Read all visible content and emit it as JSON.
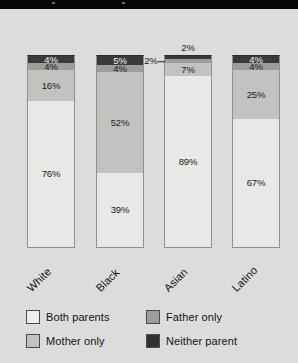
{
  "chart_data": {
    "type": "bar",
    "subtype": "stacked-bar-100",
    "title": "",
    "xlabel": "",
    "ylabel": "",
    "ylim": [
      0,
      100
    ],
    "grid": false,
    "legend_position": "bottom",
    "categories": [
      "White",
      "Black",
      "Asian",
      "Latino"
    ],
    "series": [
      {
        "name": "Both parents",
        "color": "#e8e8e6",
        "values": [
          76,
          39,
          89,
          67
        ]
      },
      {
        "name": "Mother only",
        "color": "#c2c2c0",
        "values": [
          16,
          52,
          0,
          25
        ]
      },
      {
        "name": "Father only",
        "color": "#9d9d9b",
        "values": [
          4,
          4,
          7,
          4
        ]
      },
      {
        "name": "Neither parent",
        "color": "#3a3a3a",
        "values": [
          4,
          5,
          2,
          4
        ]
      }
    ],
    "bars": [
      {
        "category": "White",
        "segments": [
          {
            "series": "Neither parent",
            "value": 4,
            "label": "4%",
            "label_style": "light",
            "label_placement": "inside"
          },
          {
            "series": "Father only",
            "value": 4,
            "label": "4%",
            "label_style": "dark",
            "label_placement": "inside"
          },
          {
            "series": "Mother only",
            "value": 16,
            "label": "16%",
            "label_style": "dark",
            "label_placement": "inside"
          },
          {
            "series": "Both parents",
            "value": 76,
            "label": "76%",
            "label_style": "dark",
            "label_placement": "inside"
          }
        ]
      },
      {
        "category": "Black",
        "segments": [
          {
            "series": "Neither parent",
            "value": 5,
            "label": "5%",
            "label_style": "light",
            "label_placement": "inside"
          },
          {
            "series": "Father only",
            "value": 4,
            "label": "4%",
            "label_style": "dark",
            "label_placement": "inside"
          },
          {
            "series": "Mother only",
            "value": 52,
            "label": "52%",
            "label_style": "dark",
            "label_placement": "inside"
          },
          {
            "series": "Both parents",
            "value": 39,
            "label": "39%",
            "label_style": "dark",
            "label_placement": "inside"
          }
        ]
      },
      {
        "category": "Asian",
        "segments": [
          {
            "series": "Neither parent",
            "value": 2,
            "label": "2%",
            "label_style": "dark",
            "label_placement": "above"
          },
          {
            "series": "Father only",
            "value": 2,
            "label": "2%",
            "label_style": "dark",
            "label_placement": "leader-left"
          },
          {
            "series": "Mother only",
            "value": 7,
            "label": "7%",
            "label_style": "dark",
            "label_placement": "inside"
          },
          {
            "series": "Both parents",
            "value": 89,
            "label": "89%",
            "label_style": "dark",
            "label_placement": "inside"
          }
        ]
      },
      {
        "category": "Latino",
        "segments": [
          {
            "series": "Neither parent",
            "value": 4,
            "label": "4%",
            "label_style": "light",
            "label_placement": "inside"
          },
          {
            "series": "Father only",
            "value": 4,
            "label": "4%",
            "label_style": "dark",
            "label_placement": "inside"
          },
          {
            "series": "Mother only",
            "value": 25,
            "label": "25%",
            "label_style": "dark",
            "label_placement": "inside"
          },
          {
            "series": "Both parents",
            "value": 67,
            "label": "67%",
            "label_style": "dark",
            "label_placement": "inside"
          }
        ]
      }
    ]
  },
  "legend": {
    "items": [
      {
        "label": "Both parents",
        "color": "#eeeeec"
      },
      {
        "label": "Father only",
        "color": "#9d9d9b"
      },
      {
        "label": "Mother only",
        "color": "#c2c2c0"
      },
      {
        "label": "Neither parent",
        "color": "#323232"
      }
    ]
  },
  "axis": {
    "tick_labels": [
      "White",
      "Black",
      "Asian",
      "Latino"
    ]
  },
  "colors": {
    "background": "#dcdcdc",
    "top_band": "#080808",
    "text": "#121212",
    "text_light": "#f2f2f2"
  }
}
